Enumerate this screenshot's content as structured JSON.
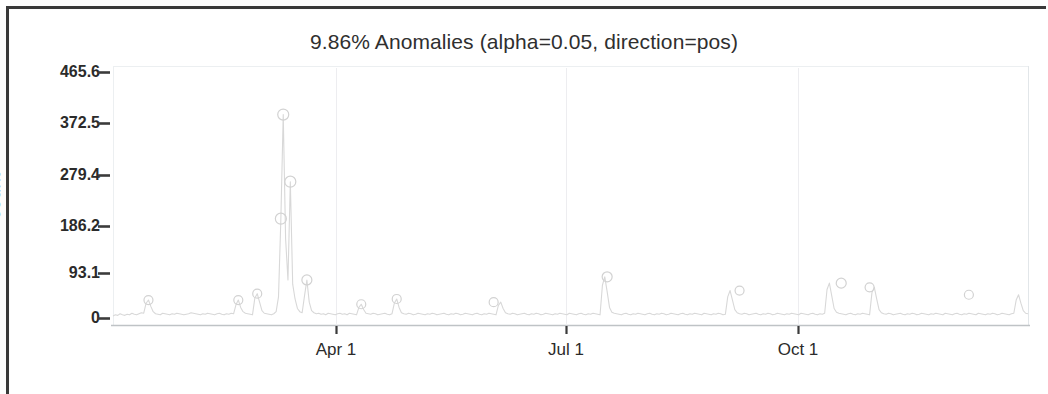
{
  "chart_data": {
    "type": "line",
    "title": "9.86% Anomalies (alpha=0.05, direction=pos)",
    "xlabel": "",
    "ylabel": "count",
    "ylim": [
      0,
      500
    ],
    "yticks": [
      0,
      93.1,
      186.2,
      279.4,
      372.5,
      465.6
    ],
    "ytick_labels": [
      "0",
      "93.1",
      "186.2",
      "279.4",
      "372.5",
      "465.6"
    ],
    "xticks": [
      "Apr 1",
      "Jul 1",
      "Oct 1"
    ],
    "xtick_positions_frac": [
      0.244,
      0.495,
      0.748
    ],
    "grid": "vertical-only-faint",
    "legend": "none",
    "line_color": "#d8d8d8",
    "marker_color": "#d2d2d2",
    "marker_shape": "circle-open",
    "series": [
      {
        "name": "count",
        "x_index": [
          0,
          1,
          2,
          3,
          4,
          5,
          6,
          7,
          8,
          9,
          10,
          11,
          12,
          13,
          14,
          15,
          16,
          17,
          18,
          19,
          20,
          21,
          22,
          23,
          24,
          25,
          26,
          27,
          28,
          29,
          30,
          31,
          32,
          33,
          34,
          35,
          36,
          37,
          38,
          39,
          40,
          41,
          42,
          43,
          44,
          45,
          46,
          47,
          48,
          49,
          50,
          51,
          52,
          53,
          54,
          55,
          56,
          57,
          58,
          59,
          60,
          61,
          62,
          63,
          64,
          65,
          66,
          67,
          68,
          69,
          70,
          71,
          72,
          73,
          74,
          75,
          76,
          77,
          78,
          79,
          80,
          81,
          82,
          83,
          84,
          85,
          86,
          87,
          88,
          89,
          90,
          91,
          92,
          93,
          94,
          95,
          96,
          97,
          98,
          99,
          100,
          101,
          102,
          103,
          104,
          105,
          106,
          107,
          108,
          109,
          110,
          111,
          112,
          113,
          114,
          115,
          116,
          117,
          118,
          119,
          120,
          121,
          122,
          123,
          124,
          125,
          126,
          127,
          128,
          129,
          130,
          131,
          132,
          133,
          134,
          135,
          136,
          137,
          138,
          139,
          140,
          141,
          142,
          143,
          144,
          145,
          146,
          147,
          148,
          149,
          150,
          151,
          152,
          153,
          154,
          155,
          156,
          157,
          158,
          159,
          160,
          161,
          162,
          163,
          164,
          165,
          166,
          167,
          168,
          169,
          170,
          171,
          172,
          173,
          174,
          175,
          176,
          177,
          178,
          179,
          180,
          181,
          182,
          183,
          184,
          185,
          186,
          187,
          188,
          189,
          190,
          191,
          192,
          193,
          194,
          195,
          196,
          197,
          198,
          199,
          200,
          201,
          202,
          203,
          204,
          205,
          206,
          207,
          208,
          209,
          210,
          211,
          212,
          213,
          214,
          215,
          216,
          217,
          218,
          219,
          220,
          221,
          222,
          223,
          224,
          225,
          226,
          227,
          228,
          229,
          230,
          231,
          232,
          233,
          234,
          235,
          236,
          237,
          238,
          239,
          240,
          241,
          242,
          243,
          244,
          245,
          246,
          247,
          248,
          249,
          250,
          251,
          252,
          253,
          254,
          255,
          256,
          257,
          258,
          259,
          260,
          261,
          262,
          263,
          264,
          265,
          266,
          267,
          268,
          269,
          270,
          271,
          272,
          273,
          274,
          275,
          276,
          277,
          278,
          279,
          280,
          281,
          282,
          283,
          284,
          285,
          286,
          287,
          288,
          289,
          290,
          291,
          292,
          293,
          294,
          295,
          296,
          297,
          298,
          299,
          300,
          301,
          302,
          303,
          304,
          305,
          306,
          307,
          308,
          309,
          310,
          311,
          312,
          313,
          314,
          315,
          316,
          317,
          318,
          319,
          320,
          321,
          322,
          323,
          324,
          325,
          326,
          327,
          328,
          329,
          330,
          331,
          332,
          333,
          334,
          335,
          336,
          337,
          338,
          339,
          340,
          341,
          342,
          343,
          344,
          345,
          346,
          347,
          348,
          349,
          350,
          351,
          352,
          353,
          354,
          355,
          356,
          357,
          358,
          359,
          360,
          361,
          362,
          363,
          364
        ],
        "values": [
          4,
          6,
          5,
          8,
          6,
          5,
          7,
          6,
          9,
          7,
          6,
          8,
          10,
          9,
          28,
          34,
          22,
          12,
          8,
          7,
          6,
          9,
          8,
          7,
          6,
          8,
          7,
          9,
          8,
          7,
          6,
          7,
          8,
          10,
          9,
          8,
          7,
          6,
          8,
          7,
          9,
          8,
          7,
          6,
          8,
          9,
          7,
          6,
          8,
          7,
          9,
          8,
          25,
          34,
          20,
          12,
          9,
          8,
          7,
          6,
          38,
          46,
          30,
          14,
          9,
          8,
          7,
          6,
          8,
          12,
          40,
          188,
          385,
          150,
          72,
          258,
          64,
          36,
          18,
          12,
          10,
          42,
          72,
          30,
          14,
          10,
          8,
          9,
          7,
          8,
          6,
          9,
          8,
          7,
          6,
          8,
          9,
          7,
          8,
          6,
          9,
          8,
          7,
          6,
          20,
          26,
          16,
          9,
          8,
          7,
          9,
          8,
          6,
          7,
          8,
          9,
          7,
          6,
          8,
          28,
          36,
          20,
          10,
          8,
          7,
          9,
          8,
          6,
          7,
          9,
          8,
          7,
          6,
          8,
          7,
          9,
          8,
          6,
          7,
          8,
          9,
          7,
          6,
          8,
          7,
          9,
          8,
          6,
          7,
          9,
          8,
          7,
          6,
          8,
          9,
          7,
          6,
          8,
          7,
          9,
          8,
          7,
          6,
          24,
          30,
          18,
          10,
          8,
          7,
          9,
          8,
          6,
          7,
          8,
          9,
          7,
          6,
          8,
          7,
          9,
          8,
          6,
          7,
          9,
          8,
          7,
          6,
          8,
          7,
          9,
          8,
          7,
          6,
          9,
          8,
          7,
          6,
          8,
          9,
          7,
          6,
          8,
          7,
          9,
          8,
          7,
          6,
          62,
          78,
          50,
          20,
          11,
          9,
          8,
          7,
          6,
          8,
          9,
          7,
          6,
          8,
          7,
          9,
          8,
          7,
          6,
          8,
          9,
          7,
          6,
          8,
          7,
          9,
          8,
          6,
          7,
          9,
          8,
          7,
          6,
          8,
          9,
          7,
          6,
          8,
          7,
          9,
          8,
          7,
          6,
          9,
          8,
          7,
          6,
          8,
          7,
          9,
          8,
          6,
          7,
          40,
          52,
          34,
          16,
          10,
          8,
          7,
          9,
          8,
          6,
          7,
          8,
          9,
          7,
          6,
          8,
          7,
          9,
          8,
          6,
          7,
          9,
          8,
          7,
          6,
          8,
          7,
          9,
          8,
          7,
          6,
          9,
          8,
          7,
          6,
          8,
          9,
          7,
          6,
          8,
          7,
          9,
          54,
          66,
          42,
          18,
          11,
          9,
          8,
          7,
          6,
          8,
          9,
          7,
          6,
          8,
          7,
          9,
          8,
          7,
          6,
          48,
          58,
          36,
          16,
          10,
          8,
          7,
          9,
          8,
          6,
          7,
          8,
          9,
          7,
          6,
          8,
          7,
          9,
          8,
          6,
          7,
          9,
          8,
          7,
          6,
          8,
          7,
          9,
          8,
          7,
          6,
          9,
          8,
          7,
          6,
          8,
          9,
          7,
          6,
          8,
          7,
          9,
          8,
          7,
          6,
          9,
          8,
          7,
          6,
          8,
          7,
          9,
          8,
          6,
          7,
          9,
          8,
          7,
          6,
          8,
          9,
          34,
          44,
          28,
          14,
          9,
          8
        ]
      }
    ],
    "anomalies": [
      {
        "x_index": 15,
        "value": 34
      },
      {
        "x_index": 53,
        "value": 34
      },
      {
        "x_index": 61,
        "value": 46
      },
      {
        "x_index": 71,
        "value": 188
      },
      {
        "x_index": 72,
        "value": 385
      },
      {
        "x_index": 75,
        "value": 258
      },
      {
        "x_index": 82,
        "value": 72
      },
      {
        "x_index": 105,
        "value": 26
      },
      {
        "x_index": 120,
        "value": 36
      },
      {
        "x_index": 161,
        "value": 30
      },
      {
        "x_index": 209,
        "value": 78
      },
      {
        "x_index": 265,
        "value": 52
      },
      {
        "x_index": 308,
        "value": 66
      },
      {
        "x_index": 320,
        "value": 58
      },
      {
        "x_index": 362,
        "value": 44
      }
    ]
  },
  "plot": {
    "title": "9.86% Anomalies (alpha=0.05, direction=pos)",
    "ylabel": "count",
    "ytick_labels": [
      "465.6",
      "372.5",
      "279.4",
      "186.2",
      "93.1",
      "0"
    ],
    "xtick_labels": [
      "Apr 1",
      "Jul 1",
      "Oct 1"
    ]
  }
}
